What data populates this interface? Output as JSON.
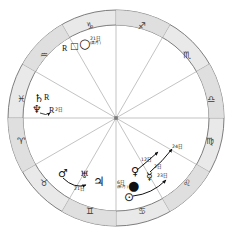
{
  "chart": {
    "type": "astrological-transit-wheel",
    "title": "",
    "center": {
      "x": 116,
      "y": 118
    },
    "ring": {
      "outer_radius": 108,
      "inner_radius": 93,
      "fill": "#e8e8e8",
      "stroke": "#6b6b6b"
    },
    "house_lines": 12,
    "zodiac_signs": [
      {
        "name": "capricorn",
        "glyph": "♑",
        "angle_deg": 105,
        "label": "♑"
      },
      {
        "name": "sagittarius",
        "glyph": "♐",
        "angle_deg": 75,
        "label": "♐"
      },
      {
        "name": "scorpio",
        "glyph": "♏",
        "angle_deg": 45,
        "label": "♏"
      },
      {
        "name": "libra",
        "glyph": "♎",
        "angle_deg": 15,
        "label": "♎"
      },
      {
        "name": "virgo",
        "glyph": "♍",
        "angle_deg": 345,
        "label": "♍"
      },
      {
        "name": "leo",
        "glyph": "♌",
        "angle_deg": 315,
        "label": "♌"
      },
      {
        "name": "cancer",
        "glyph": "♋",
        "angle_deg": 285,
        "label": "♋"
      },
      {
        "name": "gemini",
        "glyph": "♊",
        "angle_deg": 255,
        "label": "♊"
      },
      {
        "name": "taurus",
        "glyph": "♉",
        "angle_deg": 225,
        "label": "♉"
      },
      {
        "name": "aries",
        "glyph": "♈",
        "angle_deg": 195,
        "label": "♈"
      },
      {
        "name": "pisces",
        "glyph": "♓",
        "angle_deg": 165,
        "label": "♓"
      },
      {
        "name": "aquarius",
        "glyph": "♒",
        "angle_deg": 135,
        "label": "♒"
      }
    ],
    "planets": {
      "moon_full": {
        "glyph": "○",
        "label": "○",
        "date": "21日",
        "note": "(満月)"
      },
      "moon_new": {
        "glyph": "●",
        "label": "●",
        "date": "6日",
        "note": "(新月)"
      },
      "sun": {
        "glyph": "⊙",
        "label": "⊙"
      },
      "mercury": {
        "glyph": "☿",
        "label": "☿"
      },
      "venus": {
        "glyph": "♀",
        "label": "♀"
      },
      "mars": {
        "glyph": "♂",
        "label": "♂"
      },
      "jupiter": {
        "glyph": "♃",
        "label": "♃"
      },
      "saturn": {
        "glyph": "♄",
        "label": "♄"
      },
      "uranus": {
        "glyph": "♅",
        "label": "♅"
      },
      "neptune": {
        "glyph": "♆",
        "label": "♆"
      },
      "pluto_box": {
        "glyph": "⬚",
        "label": "□"
      }
    },
    "retrograde_marks": {
      "pluto_r": "R",
      "saturn_r": "R",
      "neptune_r": "R"
    },
    "date_labels": {
      "moon_full_date": "21日",
      "moon_full_note": "(満月)",
      "moon_new_date": "6日",
      "moon_new_note": "(新月)",
      "neptune_date": "2日",
      "jupiter_date": "21日",
      "venus_date": "12日",
      "mercury_date": "2日",
      "sun_date": "23日",
      "outer_date": "24日"
    }
  }
}
